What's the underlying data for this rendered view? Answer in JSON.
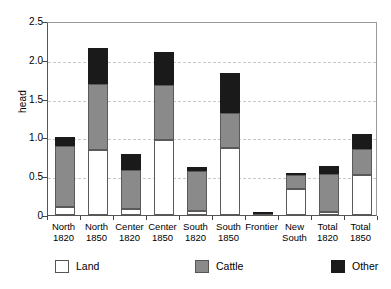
{
  "chart_data": {
    "type": "bar",
    "subtype": "stacked",
    "title": "",
    "xlabel": "",
    "ylabel": "head",
    "ylim": [
      0,
      2.5
    ],
    "yticks": [
      "0",
      "0.5",
      "1.0",
      "1.5",
      "2.0",
      "2.5"
    ],
    "ytick_values": [
      0,
      0.5,
      1.0,
      1.5,
      2.0,
      2.5
    ],
    "grid": "horizontal-dashed",
    "legend_position": "bottom",
    "categories": [
      "North\n1820",
      "North\n1850",
      "Center\n1820",
      "Center\n1850",
      "South\n1820",
      "South\n1850",
      "Frontier",
      "New\nSouth",
      "Total\n1820",
      "Total\n1850"
    ],
    "category_lines": [
      [
        "North",
        "1820"
      ],
      [
        "North",
        "1850"
      ],
      [
        "Center",
        "1820"
      ],
      [
        "Center",
        "1850"
      ],
      [
        "South",
        "1820"
      ],
      [
        "South",
        "1850"
      ],
      [
        "Frontier",
        ""
      ],
      [
        "New",
        "South"
      ],
      [
        "Total",
        "1820"
      ],
      [
        "Total",
        "1850"
      ]
    ],
    "series": [
      {
        "name": "Land",
        "color": "#ffffff",
        "values": [
          0.1,
          0.84,
          0.075,
          0.97,
          0.05,
          0.87,
          0.005,
          0.33,
          0.035,
          0.52
        ]
      },
      {
        "name": "Cattle",
        "color": "#8a8a8a",
        "values": [
          0.79,
          0.85,
          0.505,
          0.7,
          0.52,
          0.44,
          0.01,
          0.18,
          0.495,
          0.33
        ]
      },
      {
        "name": "Other",
        "color": "#1a1a1a",
        "values": [
          0.11,
          0.46,
          0.21,
          0.43,
          0.05,
          0.52,
          0.025,
          0.03,
          0.105,
          0.2
        ]
      }
    ],
    "totals": [
      1.0,
      2.15,
      0.79,
      2.1,
      0.62,
      1.83,
      0.04,
      0.54,
      0.635,
      1.05
    ],
    "cumulative_tops": {
      "land": [
        0.1,
        0.84,
        0.075,
        0.97,
        0.05,
        0.87,
        0.005,
        0.33,
        0.035,
        0.52
      ],
      "cattle": [
        0.89,
        1.69,
        0.58,
        1.67,
        0.57,
        1.31,
        0.015,
        0.51,
        0.53,
        0.85
      ],
      "other": [
        1.0,
        2.15,
        0.79,
        2.1,
        0.62,
        1.83,
        0.04,
        0.54,
        0.635,
        1.05
      ]
    }
  },
  "legend": {
    "items": [
      {
        "label": "Land",
        "swatch": "land-swatch"
      },
      {
        "label": "Cattle",
        "swatch": "cattle-swatch"
      },
      {
        "label": "Other",
        "swatch": "other-swatch"
      }
    ]
  }
}
